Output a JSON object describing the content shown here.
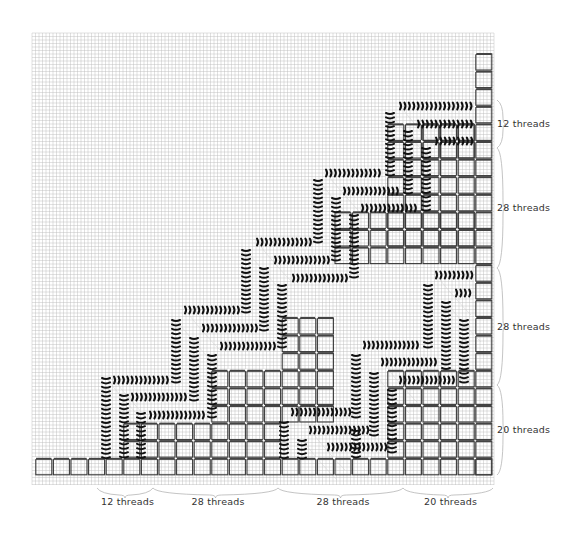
{
  "diagram": {
    "colors": {
      "background": "#ffffff",
      "grid": "#bdbdbd",
      "cell_border": "#3a3a3a",
      "cell_bar": "#444444",
      "thread": "#111111",
      "brace": "#b5b5b5",
      "label": "#333333"
    },
    "grid": {
      "x0": 32,
      "y0": 33,
      "x1": 494,
      "y1": 485,
      "step": 3.5
    },
    "cell_size": 17.6,
    "origin": {
      "x": 35,
      "y": 458
    },
    "columns": 26,
    "rows": 24
  },
  "bottom_labels": [
    {
      "text": "12 threads",
      "from": 97,
      "to": 153
    },
    {
      "text": "28 threads",
      "from": 153,
      "to": 278
    },
    {
      "text": "28 threads",
      "from": 278,
      "to": 403
    },
    {
      "text": "20 threads",
      "from": 403,
      "to": 493
    }
  ],
  "right_labels": [
    {
      "text": "12 threads",
      "from": 100,
      "to": 148
    },
    {
      "text": "28 threads",
      "from": 148,
      "to": 268
    },
    {
      "text": "28 threads",
      "from": 268,
      "to": 385
    },
    {
      "text": "20 threads",
      "from": 385,
      "to": 475
    }
  ],
  "blocks": [
    {
      "name": "bottom-row",
      "col": 0,
      "row": 0,
      "cols": 26,
      "rows": 1
    },
    {
      "name": "right-column",
      "col": 25,
      "row": 0,
      "cols": 1,
      "rows": 24
    },
    {
      "name": "block-a",
      "col": 5,
      "row": 1,
      "cols": 5,
      "rows": 2
    },
    {
      "name": "block-b",
      "col": 10,
      "row": 1,
      "cols": 4,
      "rows": 5
    },
    {
      "name": "block-c",
      "col": 14,
      "row": 3,
      "cols": 3,
      "rows": 6
    },
    {
      "name": "block-d",
      "col": 20,
      "row": 1,
      "cols": 5,
      "rows": 5
    },
    {
      "name": "block-e",
      "col": 17,
      "row": 12,
      "cols": 8,
      "rows": 3
    },
    {
      "name": "block-f",
      "col": 20,
      "row": 13,
      "cols": 5,
      "rows": 7
    },
    {
      "name": "block-g",
      "col": 22,
      "row": 18,
      "cols": 3,
      "rows": 2
    }
  ],
  "threads": [
    {
      "dir": "v",
      "x": 106,
      "y1": 378,
      "y2": 458
    },
    {
      "dir": "v",
      "x": 124,
      "y1": 395,
      "y2": 458
    },
    {
      "dir": "v",
      "x": 141,
      "y1": 413,
      "y2": 458
    },
    {
      "dir": "h",
      "y": 380,
      "x1": 114,
      "x2": 168
    },
    {
      "dir": "h",
      "y": 397,
      "x1": 132,
      "x2": 186
    },
    {
      "dir": "h",
      "y": 415,
      "x1": 150,
      "x2": 204
    },
    {
      "dir": "v",
      "x": 176,
      "y1": 320,
      "y2": 385
    },
    {
      "dir": "v",
      "x": 194,
      "y1": 338,
      "y2": 403
    },
    {
      "dir": "v",
      "x": 212,
      "y1": 355,
      "y2": 418
    },
    {
      "dir": "h",
      "y": 310,
      "x1": 185,
      "x2": 242
    },
    {
      "dir": "h",
      "y": 328,
      "x1": 203,
      "x2": 260
    },
    {
      "dir": "h",
      "y": 346,
      "x1": 221,
      "x2": 278
    },
    {
      "dir": "v",
      "x": 246,
      "y1": 250,
      "y2": 315
    },
    {
      "dir": "v",
      "x": 264,
      "y1": 268,
      "y2": 333
    },
    {
      "dir": "v",
      "x": 282,
      "y1": 285,
      "y2": 350
    },
    {
      "dir": "h",
      "y": 242,
      "x1": 257,
      "x2": 312
    },
    {
      "dir": "h",
      "y": 260,
      "x1": 275,
      "x2": 330
    },
    {
      "dir": "h",
      "y": 278,
      "x1": 293,
      "x2": 348
    },
    {
      "dir": "v",
      "x": 318,
      "y1": 180,
      "y2": 245
    },
    {
      "dir": "v",
      "x": 336,
      "y1": 198,
      "y2": 263
    },
    {
      "dir": "v",
      "x": 354,
      "y1": 215,
      "y2": 280
    },
    {
      "dir": "h",
      "y": 173,
      "x1": 326,
      "x2": 382
    },
    {
      "dir": "h",
      "y": 191,
      "x1": 344,
      "x2": 400
    },
    {
      "dir": "h",
      "y": 208,
      "x1": 362,
      "x2": 418
    },
    {
      "dir": "v",
      "x": 390,
      "y1": 113,
      "y2": 176
    },
    {
      "dir": "v",
      "x": 408,
      "y1": 131,
      "y2": 194
    },
    {
      "dir": "v",
      "x": 426,
      "y1": 148,
      "y2": 212
    },
    {
      "dir": "h",
      "y": 106,
      "x1": 400,
      "x2": 472
    },
    {
      "dir": "h",
      "y": 124,
      "x1": 418,
      "x2": 472
    },
    {
      "dir": "h",
      "y": 141,
      "x1": 436,
      "x2": 472
    },
    {
      "dir": "h",
      "y": 275,
      "x1": 436,
      "x2": 472
    },
    {
      "dir": "h",
      "y": 293,
      "x1": 456,
      "x2": 472
    },
    {
      "dir": "v",
      "x": 428,
      "y1": 285,
      "y2": 350
    },
    {
      "dir": "v",
      "x": 446,
      "y1": 302,
      "y2": 368
    },
    {
      "dir": "v",
      "x": 464,
      "y1": 320,
      "y2": 385
    },
    {
      "dir": "h",
      "y": 345,
      "x1": 364,
      "x2": 420
    },
    {
      "dir": "h",
      "y": 362,
      "x1": 382,
      "x2": 438
    },
    {
      "dir": "h",
      "y": 380,
      "x1": 400,
      "x2": 456
    },
    {
      "dir": "v",
      "x": 356,
      "y1": 355,
      "y2": 420
    },
    {
      "dir": "v",
      "x": 374,
      "y1": 373,
      "y2": 438
    },
    {
      "dir": "v",
      "x": 392,
      "y1": 390,
      "y2": 455
    },
    {
      "dir": "h",
      "y": 412,
      "x1": 292,
      "x2": 350
    },
    {
      "dir": "h",
      "y": 430,
      "x1": 310,
      "x2": 368
    },
    {
      "dir": "h",
      "y": 447,
      "x1": 328,
      "x2": 386
    },
    {
      "dir": "v",
      "x": 284,
      "y1": 422,
      "y2": 458
    },
    {
      "dir": "v",
      "x": 302,
      "y1": 440,
      "y2": 458
    },
    {
      "dir": "v",
      "x": 356,
      "y1": 430,
      "y2": 458
    }
  ]
}
